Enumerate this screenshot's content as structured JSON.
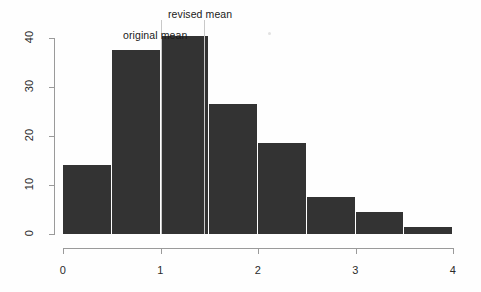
{
  "chart_data": {
    "type": "bar",
    "title": "",
    "subtitle": "",
    "xlabel": "",
    "ylabel": "",
    "xlim": [
      0,
      4
    ],
    "ylim": [
      0,
      41
    ],
    "grid": false,
    "legend": "none",
    "bin_width": 0.5,
    "categories": [
      "0-0.5",
      "0.5-1.0",
      "1.0-1.5",
      "1.5-2.0",
      "2.0-2.5",
      "2.5-3.0",
      "3.0-3.5",
      "3.5-4.0"
    ],
    "bin_starts": [
      0,
      0.5,
      1.0,
      1.5,
      2.0,
      2.5,
      3.0,
      3.5
    ],
    "bin_ends": [
      0.5,
      1.0,
      1.5,
      2.0,
      2.5,
      3.0,
      3.5,
      4.0
    ],
    "values": [
      14,
      37.5,
      40.5,
      26.5,
      18.5,
      7.5,
      4.5,
      1.5
    ],
    "bar_color": "#333333",
    "xticks": [
      0,
      1,
      2,
      3,
      4
    ],
    "xtick_labels": [
      "0",
      "1",
      "2",
      "3",
      "4"
    ],
    "yticks": [
      0,
      10,
      20,
      30,
      40
    ],
    "ytick_labels": [
      "0",
      "10",
      "20",
      "30",
      "40"
    ],
    "annotations": [
      {
        "name": "original-mean",
        "label": "original mean",
        "x_value": 1.0
      },
      {
        "name": "revised-mean",
        "label": "revised mean",
        "x_value": 1.45
      }
    ]
  },
  "axis": {
    "y_tick_labels": [
      "0",
      "10",
      "20",
      "30",
      "40"
    ],
    "x_tick_labels": [
      "0",
      "1",
      "2",
      "3",
      "4"
    ]
  },
  "annotations": {
    "original_mean": "original mean",
    "revised_mean": "revised mean"
  },
  "colors": {
    "bar": "#333333",
    "axis": "#9a9a9a",
    "text": "#2b2b2b",
    "annotation_line": "#c8c8c8",
    "background": "#ffffff"
  }
}
